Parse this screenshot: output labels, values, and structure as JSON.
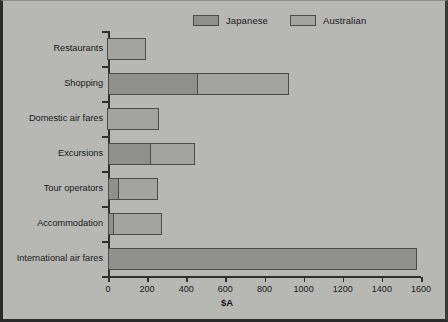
{
  "chart_data": {
    "type": "bar",
    "orientation": "horizontal",
    "stacked": true,
    "title": "",
    "xlabel": "$A",
    "ylabel": "",
    "xlim": [
      0,
      1600
    ],
    "xticks": [
      0,
      200,
      400,
      600,
      800,
      1000,
      1200,
      1400,
      1600
    ],
    "xticklabels": [
      "0",
      "200",
      "400",
      "600",
      "800",
      "1000",
      "1200",
      "1400",
      "1600"
    ],
    "grid": false,
    "legend_position": "top-center",
    "categories": [
      "Restaurants",
      "Shopping",
      "Domestic air fares",
      "Excursions",
      "Tour operators",
      "Accommodation",
      "International air fares"
    ],
    "series": [
      {
        "name": "Japanese",
        "color": "#8f8f8b",
        "values": [
          0,
          460,
          0,
          220,
          55,
          30,
          1580
        ]
      },
      {
        "name": "Australian",
        "color": "#a3a39f",
        "values": [
          200,
          470,
          265,
          230,
          205,
          250,
          0
        ]
      }
    ],
    "totals": [
      200,
      930,
      265,
      450,
      260,
      280,
      1580
    ]
  },
  "legend": {
    "entries": [
      {
        "label": "Japanese",
        "swatch_name": "legend-swatch-japanese"
      },
      {
        "label": "Australian",
        "swatch_name": "legend-swatch-australian"
      }
    ]
  },
  "axis": {
    "x_title": "$A"
  }
}
